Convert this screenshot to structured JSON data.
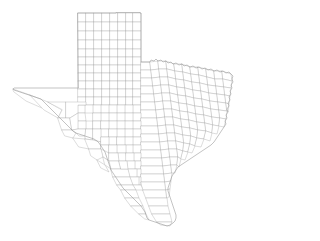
{
  "figure": {
    "kind": "choropleth-outline-map",
    "title": "",
    "background_color": "#ffffff",
    "county_fill_color": "#ffffff",
    "county_stroke_color": "#b4b4b4",
    "state_stroke_color": "#9a9a9a",
    "county_count": 254,
    "projection_note": "",
    "legend": [],
    "annotations": [],
    "labels": []
  },
  "map": {
    "view_box": "0 0 248 241",
    "width": 248,
    "height": 241,
    "extent": {
      "left_px": 13,
      "right_px": 234,
      "top_px": 13,
      "bottom_px": 226
    },
    "regions": [
      {
        "name": "panhandle",
        "description": "regular grid of square counties, north"
      },
      {
        "name": "west-texas",
        "description": "large counties, far west / Big Bend"
      },
      {
        "name": "north-central",
        "description": "Red River border, jagged north edge"
      },
      {
        "name": "east-texas",
        "description": "Sabine River border, small counties"
      },
      {
        "name": "gulf-coast",
        "description": "bays, barrier islands, southeast"
      },
      {
        "name": "south-texas",
        "description": "Rio Grande valley, southern tip"
      }
    ],
    "state_outline_path": "M78,13 L116,13 L116,12.5 L140,12.5 L140,13 L141,13 L141,62 L150,62 L151,60 L154,61 L156,59 L158,61 L161,60 L163,62 L166,61 L168,63 L171,62 L173,64 L176,63 L179,65 L182,64 L184,66 L187,65 L190,67 L193,66 L196,68 L199,67 L202,69 L205,68 L208,70 L211,69 L214,71 L217,70 L220,72 L223,71 L226,73 L229,72 L231,74 L233,76 L232,79 L233,82 L231,85 L232,88 L230,91 L231,94 L229,97 L230,100 L228,103 L229,106 L227,109 L228,112 L226,115 L227,118 L225,121 L226,124 L224,127 L222,130 L220,133 L218,136 L216,139 L214,142 L211,145 L208,147 L205,149 L202,151 L199,153 L196,155 L193,157 L190,159 L187,161 L184,163 L181,165 L178,167 L176,170 L174,173 L172,176 L171,179 L170,182 L169,185 L168,188 L168,191 L169,194 L170,197 L171,200 L172,203 L173,206 L174,209 L175,212 L176,215 L176,218 L175,221 L173,223 L170,225 L167,226 L164,225 L161,224 L158,223 L155,222 L152,221 L149,220 L147,218 L146,215 L145,212 L143,209 L141,206 L139,204 L137,202 L135,200 L133,198 L131,196 L129,194 L127,192 L125,190 L123,188 L121,185 L119,182 L117,179 L115,176 L113,173 L111,170 L110,167 L109,164 L108,161 L107,158 L106,155 L105,152 L103,149 L101,146 L99,143 L97,141 L94,139 L91,138 L88,137 L85,136 L82,135 L79,134 L76,133 L73,131 L71,129 L69,127 L67,125 L65,123 L63,121 L61,119 L59,117 L57,115 L55,113 L53,111 L51,109 L49,107 L47,105 L45,103 L43,101 L41,99 L38,98 L35,97 L32,96 L29,95 L26,94 L23,93 L20,92 L17,91 L14,90 L13,89 L14,88 L17,88 L20,88 L23,88 L26,88 L29,88 L32,88 L35,88 L38,88 L41,88 L44,88 L47,88 L50,88 L53,88 L56,88 L59,88 L62,88 L65,88 L68,88 L71,88 L74,88 L77,88 L78,88 Z",
    "county_paths": [
      "M78,13 L86,13 L86,22 L78,22 Z",
      "M86,13 L94,13 L94,22 L86,22 Z",
      "M94,13 L102,13 L102,22 L94,22 Z",
      "M102,13 L110,13 L110,22 L102,22 Z",
      "M110,13 L118,13 L118,22 L110,22 Z",
      "M118,13 L126,13 L126,22 L118,22 Z",
      "M126,13 L133,13 L133,22 L126,22 Z",
      "M133,13 L141,13 L141,22 L133,22 Z",
      "M78,22 L86,22 L86,31 L78,31 Z",
      "M86,22 L94,22 L94,31 L86,31 Z",
      "M94,22 L102,22 L102,31 L94,31 Z",
      "M102,22 L110,22 L110,31 L102,31 Z",
      "M110,22 L118,22 L118,31 L110,31 Z",
      "M118,22 L126,22 L126,31 L118,31 Z",
      "M126,22 L133,22 L133,31 L126,31 Z",
      "M133,22 L141,22 L141,31 L133,31 Z",
      "M78,31 L86,31 L86,40 L78,40 Z",
      "M86,31 L94,31 L94,40 L86,40 Z",
      "M94,31 L102,31 L102,40 L94,40 Z",
      "M102,31 L110,31 L110,40 L102,40 Z",
      "M110,31 L118,31 L118,40 L110,40 Z",
      "M118,31 L126,31 L126,40 L118,40 Z",
      "M126,31 L133,31 L133,40 L126,40 Z",
      "M133,31 L141,31 L141,40 L133,40 Z",
      "M78,40 L86,40 L86,49 L78,49 Z",
      "M86,40 L94,40 L94,49 L86,49 Z",
      "M94,40 L102,40 L102,49 L94,49 Z",
      "M102,40 L110,40 L110,49 L102,49 Z",
      "M110,40 L118,40 L118,49 L110,49 Z",
      "M118,40 L126,40 L126,49 L118,49 Z",
      "M126,40 L133,40 L133,49 L126,49 Z",
      "M133,40 L141,40 L141,49 L133,49 Z",
      "M78,49 L86,49 L86,57 L78,57 Z",
      "M86,49 L94,49 L94,57 L86,57 Z",
      "M94,49 L102,49 L102,57 L94,57 Z",
      "M102,49 L110,49 L110,57 L102,57 Z",
      "M110,49 L118,49 L118,57 L110,57 Z",
      "M118,49 L126,49 L126,57 L118,57 Z",
      "M126,49 L133,49 L133,57 L126,57 Z",
      "M133,49 L141,49 L141,57 L133,57 Z",
      "M78,57 L86,57 L86,65 L78,65 Z",
      "M86,57 L94,57 L94,65 L86,65 Z",
      "M94,57 L102,57 L102,65 L94,65 Z",
      "M102,57 L110,57 L110,65 L102,65 Z",
      "M110,57 L118,57 L118,65 L110,65 Z",
      "M118,57 L126,57 L126,65 L118,65 Z",
      "M126,57 L133,57 L133,65 L126,65 Z",
      "M133,57 L141,57 L141,65 L133,65 Z",
      "M78,65 L86,65 L86,73 L78,73 Z",
      "M86,65 L94,65 L94,73 L86,73 Z",
      "M94,65 L102,65 L102,73 L94,73 Z",
      "M102,65 L110,65 L110,73 L102,73 Z",
      "M110,65 L118,65 L118,73 L110,73 Z",
      "M118,65 L126,65 L126,73 L118,73 Z",
      "M126,65 L133,65 L133,73 L126,73 Z",
      "M133,65 L141,65 L141,73 L133,73 Z",
      "M78,73 L86,73 L86,81 L78,81 Z",
      "M86,73 L94,73 L94,81 L86,81 Z",
      "M94,73 L102,73 L102,81 L94,81 Z",
      "M102,73 L110,73 L110,81 L102,81 Z",
      "M110,73 L118,73 L118,81 L110,81 Z",
      "M118,73 L126,73 L126,81 L118,81 Z",
      "M126,73 L133,73 L133,81 L126,81 Z",
      "M133,73 L141,73 L141,81 L133,81 Z",
      "M78,81 L86,81 L86,89 L78,89 Z",
      "M86,81 L94,81 L94,89 L86,89 Z",
      "M94,81 L102,81 L102,89 L94,89 Z",
      "M102,81 L110,81 L110,89 L102,89 Z",
      "M110,81 L118,81 L118,89 L110,89 Z",
      "M118,81 L126,81 L126,89 L118,89 Z",
      "M126,81 L133,81 L133,89 L126,89 Z",
      "M133,81 L141,81 L141,89 L133,89 Z",
      "M78,89 L86,89 L86,97 L78,97 Z",
      "M86,89 L94,89 L94,97 L86,97 Z",
      "M94,89 L102,89 L102,97 L94,97 Z",
      "M102,89 L110,89 L110,97 L102,97 Z",
      "M110,89 L118,89 L118,97 L110,97 Z",
      "M118,89 L126,89 L126,97 L118,97 Z",
      "M126,89 L133,89 L133,97 L126,97 Z",
      "M133,89 L141,89 L141,97 L133,97 Z",
      "M78,97 L86,97 L86,105 L78,105 Z",
      "M86,97 L94,97 L94,105 L86,105 Z",
      "M94,97 L102,97 L102,105 L94,105 Z",
      "M102,97 L110,97 L110,105 L102,105 Z",
      "M110,97 L118,97 L118,105 L110,105 Z",
      "M118,97 L126,97 L126,105 L118,105 Z",
      "M126,97 L133,97 L133,105 L126,105 Z",
      "M133,97 L141,97 L141,105 L133,105 Z",
      "M141,62 L150,62 L151,70 L141,70 Z",
      "M150,62 L158,61 L159,69 L151,70 Z",
      "M158,61 L166,61 L167,69 L159,69 Z",
      "M166,61 L174,64 L175,71 L167,69 Z",
      "M174,64 L182,64 L183,72 L175,71 Z",
      "M182,64 L190,67 L191,74 L183,72 Z",
      "M190,67 L198,67 L199,75 L191,74 Z",
      "M198,67 L206,69 L207,77 L199,75 Z",
      "M206,69 L214,71 L215,79 L207,77 Z",
      "M214,71 L222,71 L223,79 L215,79 Z",
      "M222,71 L231,74 L232,81 L223,79 Z",
      "M141,70 L151,70 L152,78 L141,78 Z",
      "M151,70 L159,69 L160,77 L152,78 Z",
      "M159,69 L167,69 L168,77 L160,77 Z",
      "M167,69 L175,71 L176,79 L168,77 Z",
      "M175,71 L183,72 L184,80 L176,79 Z",
      "M183,72 L191,74 L192,82 L184,80 Z",
      "M191,74 L199,75 L200,83 L192,82 Z",
      "M199,75 L207,77 L208,85 L200,83 Z",
      "M207,77 L215,79 L216,86 L208,85 Z",
      "M215,79 L223,79 L224,87 L216,86 Z",
      "M223,79 L232,81 L231,88 L224,87 Z",
      "M141,78 L152,78 L153,86 L141,86 Z",
      "M152,78 L160,77 L161,85 L153,86 Z",
      "M160,77 L168,77 L169,85 L161,85 Z",
      "M168,77 L176,79 L177,87 L169,85 Z",
      "M176,79 L184,80 L185,88 L177,87 Z",
      "M184,80 L192,82 L193,90 L185,88 Z",
      "M192,82 L200,83 L201,91 L193,90 Z",
      "M200,83 L208,85 L209,93 L201,91 Z",
      "M208,85 L216,86 L217,94 L209,93 Z",
      "M216,86 L224,87 L225,95 L217,94 Z",
      "M224,87 L231,88 L230,96 L225,95 Z",
      "M141,86 L153,86 L154,94 L141,94 Z",
      "M153,86 L161,85 L162,93 L154,94 Z",
      "M161,85 L169,85 L170,93 L162,93 Z",
      "M169,85 L177,87 L178,95 L170,93 Z",
      "M177,87 L185,88 L186,96 L178,95 Z",
      "M185,88 L193,90 L194,98 L186,96 Z",
      "M193,90 L201,91 L202,99 L194,98 Z",
      "M201,91 L209,93 L210,101 L202,99 Z",
      "M209,93 L217,94 L218,102 L210,101 Z",
      "M217,94 L225,95 L226,103 L218,102 Z",
      "M225,95 L230,96 L229,104 L226,103 Z",
      "M141,94 L154,94 L155,102 L141,102 Z",
      "M154,94 L162,93 L163,101 L155,102 Z",
      "M162,93 L170,93 L171,101 L163,101 Z",
      "M170,93 L178,95 L179,103 L171,101 Z",
      "M178,95 L186,96 L187,104 L179,103 Z",
      "M186,96 L194,98 L195,106 L187,104 Z",
      "M194,98 L202,99 L203,107 L195,106 Z",
      "M202,99 L210,101 L211,109 L203,107 Z",
      "M210,101 L218,102 L219,110 L211,109 Z",
      "M218,102 L226,103 L227,111 L219,110 Z",
      "M226,103 L229,104 L228,112 L227,111 Z",
      "M133,105 L141,105 L141,113 L133,113 Z",
      "M141,102 L155,102 L156,110 L141,110 Z",
      "M155,102 L163,101 L164,109 L156,110 Z",
      "M163,101 L171,101 L172,109 L164,109 Z",
      "M171,101 L179,103 L180,111 L172,109 Z",
      "M179,103 L187,104 L188,112 L180,111 Z",
      "M187,104 L195,106 L196,114 L188,112 Z",
      "M195,106 L203,107 L204,115 L196,114 Z",
      "M203,107 L211,109 L212,117 L204,115 Z",
      "M211,109 L219,110 L220,118 L212,117 Z",
      "M219,110 L227,111 L226,119 L220,118 Z",
      "M125,105 L133,105 L133,113 L125,113 Z",
      "M117,105 L125,105 L125,113 L117,113 Z",
      "M109,105 L117,105 L117,113 L109,113 Z",
      "M101,105 L109,105 L109,113 L101,113 Z",
      "M93,105 L101,105 L101,113 L93,113 Z",
      "M85,105 L93,105 L93,113 L85,113 Z",
      "M78,105 L85,105 L85,113 L78,113 Z",
      "M141,110 L156,110 L157,118 L141,118 Z",
      "M156,110 L164,109 L165,117 L157,118 Z",
      "M164,109 L172,109 L173,117 L165,117 Z",
      "M172,109 L180,111 L181,119 L173,117 Z",
      "M180,111 L188,112 L189,120 L181,119 Z",
      "M188,112 L196,114 L197,122 L189,120 Z",
      "M196,114 L204,115 L205,123 L197,122 Z",
      "M204,115 L212,117 L213,125 L205,123 Z",
      "M212,117 L220,118 L219,126 L213,125 Z",
      "M220,118 L226,119 L224,127 L219,126 Z",
      "M133,113 L141,113 L141,121 L133,121 Z",
      "M125,113 L133,113 L133,121 L125,121 Z",
      "M117,113 L125,113 L125,121 L117,121 Z",
      "M109,113 L117,113 L117,121 L109,121 Z",
      "M101,113 L109,113 L109,121 L101,121 Z",
      "M93,113 L101,113 L101,121 L93,121 Z",
      "M141,118 L157,118 L158,126 L141,126 Z",
      "M157,118 L165,117 L166,125 L158,126 Z",
      "M165,117 L173,117 L174,125 L166,125 Z",
      "M173,117 L181,119 L182,127 L174,125 Z",
      "M181,119 L189,120 L190,128 L182,127 Z",
      "M189,120 L197,122 L198,130 L190,128 Z",
      "M197,122 L205,123 L206,131 L198,130 Z",
      "M205,123 L213,125 L212,133 L206,131 Z",
      "M213,125 L219,126 L217,134 L212,133 Z",
      "M133,121 L141,121 L141,129 L133,129 Z",
      "M125,121 L133,121 L133,129 L125,129 Z",
      "M117,121 L125,121 L125,129 L117,129 Z",
      "M109,121 L117,121 L117,129 L109,129 Z",
      "M141,126 L158,126 L159,134 L141,134 Z",
      "M158,126 L166,125 L167,133 L159,134 Z",
      "M166,125 L174,125 L175,133 L167,133 Z",
      "M174,125 L182,127 L183,135 L175,133 Z",
      "M182,127 L190,128 L191,136 L183,135 Z",
      "M190,128 L198,130 L197,138 L191,136 Z",
      "M198,130 L206,131 L204,139 L197,138 Z",
      "M206,131 L212,133 L210,141 L204,139 Z",
      "M133,129 L141,129 L141,137 L133,137 Z",
      "M125,129 L133,129 L133,137 L125,137 Z",
      "M117,129 L125,129 L125,137 L117,137 Z",
      "M141,134 L159,134 L160,142 L141,142 Z",
      "M159,134 L167,133 L168,141 L160,142 Z",
      "M167,133 L175,133 L176,141 L168,141 Z",
      "M175,133 L183,135 L184,143 L176,141 Z",
      "M183,135 L191,136 L190,144 L184,143 Z",
      "M191,136 L197,138 L195,146 L190,144 Z",
      "M197,138 L204,139 L201,147 L195,146 Z",
      "M133,137 L141,137 L141,145 L133,145 Z",
      "M125,137 L133,137 L133,145 L125,145 Z",
      "M141,142 L160,142 L161,150 L141,150 Z",
      "M160,142 L168,141 L169,149 L161,150 Z",
      "M168,141 L176,141 L177,149 L169,149 Z",
      "M176,141 L184,143 L183,151 L177,149 Z",
      "M184,143 L190,144 L188,152 L183,151 Z",
      "M190,144 L195,146 L192,153 L188,152 Z",
      "M133,145 L141,145 L141,153 L133,153 Z",
      "M126,145 L133,145 L133,153 L126,153 Z",
      "M141,150 L161,150 L162,158 L141,158 Z",
      "M161,150 L169,149 L170,157 L162,158 Z",
      "M169,149 L177,149 L178,157 L170,157 Z",
      "M177,149 L183,151 L181,159 L178,157 Z",
      "M183,151 L188,152 L185,160 L181,159 Z",
      "M134,153 L141,153 L141,161 L134,161 Z",
      "M141,158 L162,158 L163,166 L141,166 Z",
      "M162,158 L170,157 L171,165 L163,166 Z",
      "M170,157 L178,157 L177,165 L171,165 Z",
      "M178,157 L181,159 L179,167 L177,165 Z",
      "M135,161 L141,161 L141,169 L135,169 Z",
      "M141,166 L163,166 L164,174 L141,174 Z",
      "M163,166 L171,165 L172,173 L164,174 Z",
      "M171,165 L177,165 L175,173 L172,173 Z",
      "M137,169 L141,169 L141,177 L137,177 Z",
      "M141,174 L164,174 L165,182 L141,182 Z",
      "M164,174 L172,173 L171,181 L165,182 Z",
      "M139,177 L141,177 L141,185 L139,185 Z",
      "M141,182 L165,182 L166,190 L143,190 Z",
      "M165,182 L171,181 L170,189 L166,190 Z",
      "M143,190 L166,190 L167,198 L146,198 Z",
      "M166,190 L170,189 L169,197 L167,198 Z",
      "M146,198 L167,198 L168,206 L149,206 Z",
      "M149,206 L168,206 L170,214 L152,214 Z",
      "M152,214 L170,214 L172,222 L157,222 Z",
      "M157,222 L172,222 L170,226 L161,225 Z",
      "M78,113 L85,113 L86,121 L78,121 Z",
      "M86,121 L93,121 L93,129 L86,129 Z",
      "M78,121 L86,121 L86,129 L78,129 Z",
      "M93,121 L101,121 L101,129 L93,129 Z",
      "M101,121 L109,121 L109,129 L101,129 Z",
      "M101,129 L109,129 L109,137 L101,137 Z",
      "M109,129 L117,129 L117,137 L109,137 Z",
      "M109,137 L117,137 L117,145 L109,145 Z",
      "M117,137 L125,137 L125,145 L117,145 Z",
      "M117,145 L126,145 L126,153 L117,153 Z",
      "M118,153 L126,153 L127,161 L119,161 Z",
      "M126,153 L134,153 L134,161 L126,161 Z",
      "M127,161 L135,161 L135,169 L128,169 Z",
      "M128,169 L137,169 L137,177 L130,177 Z",
      "M130,177 L139,177 L139,185 L133,185 Z",
      "M133,185 L141,185 L143,190 L136,190 Z",
      "M13,89 L30,95 L44,102 L42,108 L26,101 L14,92 Z",
      "M30,95 L48,102 L62,110 L58,118 L44,110 L42,108 Z",
      "M48,102 L66,102 L66,118 L58,118 L62,110 Z",
      "M66,102 L86,102 L86,105 L78,105 L78,113 L70,118 L66,118 Z",
      "M58,118 L70,118 L72,130 L62,130 Z",
      "M70,118 L78,113 L78,121 L78,129 L72,130 Z",
      "M62,130 L72,130 L76,133 L73,138 L65,136 Z",
      "M72,130 L78,129 L86,129 L85,136 L79,136 L76,133 Z",
      "M86,129 L93,129 L93,140 L85,139 L85,136 Z",
      "M93,129 L101,129 L101,137 L101,142 L93,140 Z",
      "M73,138 L85,139 L91,141 L89,149 L79,147 Z",
      "M85,139 L93,140 L101,142 L101,149 L91,149 L89,149 Z",
      "M101,137 L109,137 L109,145 L101,145 Z",
      "M101,145 L109,145 L109,153 L101,153 Z",
      "M101,149 L109,153 L109,161 L103,157 Z",
      "M89,149 L101,149 L103,157 L97,160 L91,156 Z",
      "M109,145 L117,145 L117,153 L109,153 Z",
      "M109,153 L118,153 L119,161 L109,161 Z",
      "M109,161 L119,161 L121,169 L111,169 Z",
      "M111,169 L128,169 L130,177 L113,177 Z",
      "M113,177 L130,177 L133,185 L117,185 Z",
      "M117,185 L133,185 L136,190 L121,190 Z",
      "M121,190 L136,190 L139,198 L125,198 Z",
      "M125,198 L139,198 L143,206 L131,206 Z",
      "M131,206 L143,206 L146,214 L139,214 Z",
      "M139,214 L146,214 L149,220 L145,219 Z",
      "M119,161 L127,161 L128,169 L121,169 Z",
      "M103,157 L109,161 L111,169 L105,165 Z",
      "M97,160 L105,165 L109,172 L101,168 Z"
    ]
  }
}
